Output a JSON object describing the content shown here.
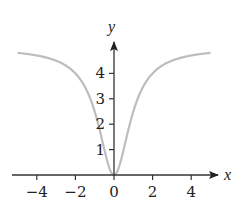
{
  "chart_data": {
    "type": "line",
    "title": "",
    "xlabel": "x",
    "ylabel": "y",
    "xlim": [
      -5,
      5
    ],
    "ylim": [
      0,
      5
    ],
    "grid": false,
    "legend": null,
    "x_ticks": [
      -4,
      -2,
      0,
      2,
      4
    ],
    "x_tick_labels": [
      "−4",
      "−2",
      "0",
      "2",
      "4"
    ],
    "y_ticks": [
      1,
      2,
      3,
      4
    ],
    "y_tick_labels": [
      "1",
      "2",
      "3",
      "4"
    ],
    "series": [
      {
        "name": "y = 5x²/(1+x²)",
        "color": "#bdbdbd",
        "x": [
          -5,
          -4,
          -3,
          -2,
          -1.5,
          -1,
          -0.5,
          0,
          0.5,
          1,
          1.5,
          2,
          3,
          4,
          5
        ],
        "y": [
          4.81,
          4.71,
          4.5,
          4.0,
          3.46,
          2.5,
          1.0,
          0,
          1.0,
          2.5,
          3.46,
          4.0,
          4.5,
          4.71,
          4.81
        ]
      }
    ],
    "axis_color": "#333333"
  }
}
